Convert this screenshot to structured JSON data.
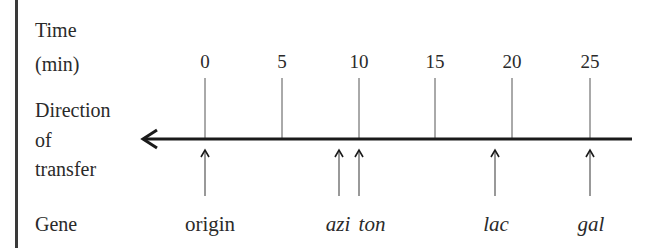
{
  "labels": {
    "time_line1": "Time",
    "time_line2": "(min)",
    "direction_line1": "Direction",
    "direction_line2": "of",
    "direction_line3": "transfer",
    "gene": "Gene"
  },
  "ticks": [
    {
      "value": "0",
      "x": 205
    },
    {
      "value": "5",
      "x": 282
    },
    {
      "value": "10",
      "x": 359
    },
    {
      "value": "15",
      "x": 435
    },
    {
      "value": "20",
      "x": 512
    },
    {
      "value": "25",
      "x": 590
    }
  ],
  "genes": [
    {
      "name": "origin",
      "x": 205,
      "label_x": 210,
      "italic": false
    },
    {
      "name": "azi",
      "x": 339,
      "label_x": 338,
      "italic": true
    },
    {
      "name": "ton",
      "x": 359,
      "label_x": 372,
      "italic": true
    },
    {
      "name": "lac",
      "x": 495,
      "label_x": 496,
      "italic": true
    },
    {
      "name": "gal",
      "x": 590,
      "label_x": 591,
      "italic": true
    }
  ],
  "axis": {
    "y": 139,
    "x_start": 143,
    "x_end": 632,
    "direction": "left"
  },
  "colors": {
    "line": "#1a1a1a",
    "tick": "#555555",
    "text": "#2a2a2a"
  }
}
